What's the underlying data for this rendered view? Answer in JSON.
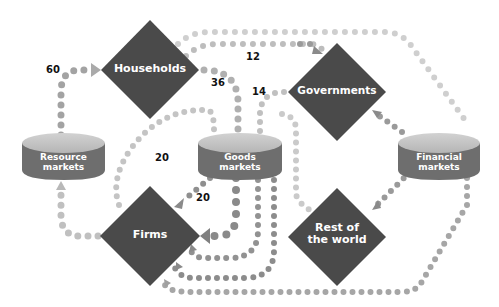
{
  "nodes": {
    "households": {
      "label": "Households",
      "shape": "diamond"
    },
    "governments": {
      "label": "Governments",
      "shape": "diamond"
    },
    "firms": {
      "label": "Firms",
      "shape": "diamond"
    },
    "rest_of_world": {
      "label_line1": "Rest of",
      "label_line2": "the world",
      "shape": "diamond"
    },
    "resource_markets": {
      "label_line1": "Resource",
      "label_line2": "markets",
      "shape": "cylinder"
    },
    "goods_markets": {
      "label_line1": "Goods",
      "label_line2": "markets",
      "shape": "cylinder"
    },
    "financial_markets": {
      "label_line1": "Financial",
      "label_line2": "markets",
      "shape": "cylinder"
    }
  },
  "flow_labels": {
    "resource_to_households": "60",
    "households_to_governments": "12",
    "households_to_goods": "36",
    "governments_to_goods": "14",
    "firms_to_goods": "20",
    "goods_to_firms": "20"
  },
  "colors": {
    "diamond": "#4a4a4a",
    "cylinder_body": "#6e6e6e",
    "cylinder_top": "#c4c4c4",
    "dot_dark": "#8c8c8c",
    "dot_light": "#c8c8c8",
    "dot_mid": "#a8a8a8"
  }
}
